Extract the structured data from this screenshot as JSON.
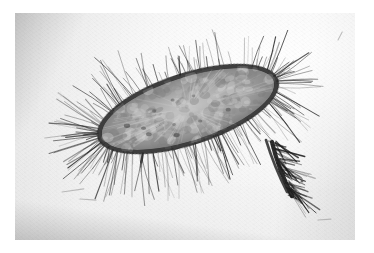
{
  "figure": {
    "kind": "electron-micrograph",
    "modality": "transmission electron micrograph, negative stain",
    "orientation_degrees": -18,
    "caption": ""
  },
  "canvas": {
    "width": 374,
    "height": 253,
    "page_background": "#ffffff"
  },
  "photo": {
    "left": 15,
    "top": 13,
    "width": 340,
    "height": 227,
    "background": "#f3f3f3",
    "border": "none",
    "vignette_edges": [
      "left",
      "bottom"
    ]
  },
  "palette": {
    "page": "#ffffff",
    "print_base": "#f3f3f3",
    "background_light": "#f5f5f5",
    "vignette_gray": "#b9b9b9",
    "cell_interior_light": "#c9c9c9",
    "cell_interior_mid": "#a2a2a2",
    "cell_interior_dark": "#6e6e6e",
    "cell_rim": "#2b2b2b",
    "fimbriae_dark": "#1f1f1f",
    "fimbriae_mid": "#5a5a5a",
    "debris": "#8a8a8a"
  },
  "specimen": {
    "cell_body": {
      "name": "bacterial-cell-body",
      "center_x": 188,
      "center_y": 109,
      "radius_x": 93,
      "radius_y": 34,
      "rotation_degrees": -18,
      "rim_thickness_px": 5,
      "rim_color": "#2b2b2b",
      "interior_texture": "granular mottled cytoplasm with radiating light striations"
    },
    "fimbriae": {
      "name": "fimbriae-halo",
      "count": 300,
      "description": "dense radiating filaments surrounding the entire cell",
      "extent_left_x": 35,
      "extent_right_x": 322,
      "extent_top_y": 45,
      "extent_bottom_y": 200,
      "densest_regions": [
        "left-pole",
        "lower-right-tuft"
      ],
      "length_min_px": 8,
      "length_max_px": 46
    },
    "tuft": {
      "name": "lower-right-fimbrial-tuft",
      "origin_x": 272,
      "origin_y": 142,
      "tip_x": 292,
      "tip_y": 196,
      "description": "thick dark bundle of fimbriae trailing down-right"
    },
    "debris": [
      {
        "name": "debris-filament-1",
        "x": 62,
        "y": 192,
        "length": 22,
        "angle": -8
      },
      {
        "name": "debris-filament-2",
        "x": 80,
        "y": 199,
        "length": 16,
        "angle": 4
      },
      {
        "name": "debris-speck-1",
        "x": 302,
        "y": 181,
        "size": 3
      },
      {
        "name": "debris-filament-3",
        "x": 318,
        "y": 220,
        "length": 13,
        "angle": -4
      },
      {
        "name": "debris-streak-upper-right",
        "x": 338,
        "y": 40,
        "length": 9,
        "angle": -62
      }
    ]
  }
}
